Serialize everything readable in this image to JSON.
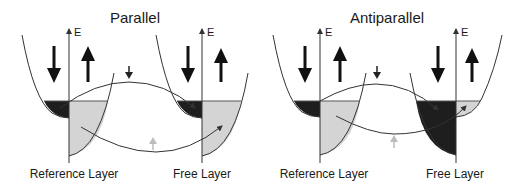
{
  "figure": {
    "panels": [
      {
        "id": "parallel",
        "title": "Parallel",
        "axis_label": "E",
        "left_layer_label": "Reference Layer",
        "right_layer_label": "Free Layer",
        "left_layer": {
          "spin_down_band": "filled-dark",
          "spin_up_band": "filled-light"
        },
        "right_layer": {
          "spin_down_band": "filled-dark",
          "spin_up_band": "filled-light"
        },
        "tunneling": [
          {
            "spin": "down",
            "from": "reference-spin-down",
            "to": "free-spin-down",
            "arrow_color": "dark"
          },
          {
            "spin": "up",
            "from": "reference-spin-up",
            "to": "free-spin-up",
            "arrow_color": "light-gray"
          }
        ]
      },
      {
        "id": "antiparallel",
        "title": "Antiparallel",
        "axis_label": "E",
        "left_layer_label": "Reference Layer",
        "right_layer_label": "Free Layer",
        "left_layer": {
          "spin_down_band": "filled-dark",
          "spin_up_band": "filled-light"
        },
        "right_layer": {
          "spin_down_band": "filled-dark-large",
          "spin_up_band": "filled-light-small"
        },
        "tunneling": [
          {
            "spin": "down",
            "from": "reference-spin-down",
            "to": "free-spin-down",
            "arrow_color": "dark"
          },
          {
            "spin": "up",
            "from": "reference-spin-up",
            "to": "free-spin-up",
            "arrow_color": "light-gray"
          }
        ]
      }
    ],
    "colors": {
      "line": "#333333",
      "dark_fill": "#1e1e1e",
      "light_fill": "#d4d4d4",
      "gray_arrow": "#bdbdbd"
    }
  }
}
